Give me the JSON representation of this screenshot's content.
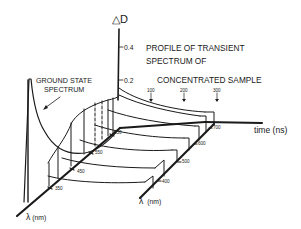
{
  "diagram": {
    "title_lines": [
      "PROFILE OF TRANSIENT",
      "SPECTRUM OF",
      "CONCENTRATED SAMPLE"
    ],
    "ground_state_label_lines": [
      "GROUND STATE",
      "SPECTRUM"
    ],
    "y_axis": {
      "label_symbol": "△",
      "label_letter": "D",
      "ticks": [
        "0.4",
        "0.2"
      ]
    },
    "time_axis": {
      "label": "time (ns)",
      "ticks": [
        "100",
        "200",
        "300"
      ]
    },
    "wavelength_axis_front": {
      "label_symbol": "λ",
      "label_unit": "(nm)",
      "ticks": [
        "350",
        "450",
        "550",
        "650"
      ]
    },
    "wavelength_axis_right": {
      "label_symbol": "λ",
      "label_unit": "(nm)",
      "ticks": [
        "400",
        "500",
        "600",
        "700"
      ]
    },
    "colors": {
      "ink": "#1a1a1a",
      "background": "#ffffff"
    }
  }
}
